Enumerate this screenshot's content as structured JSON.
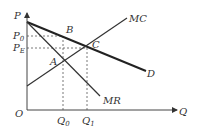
{
  "diagram": {
    "type": "monopoly-pricing",
    "axes": {
      "y_label": "P",
      "x_label": "Q",
      "origin_label": "O"
    },
    "curves": {
      "demand": {
        "label": "D",
        "color": "#222222"
      },
      "marginal_revenue": {
        "label": "MR",
        "color": "#333333"
      },
      "marginal_cost": {
        "label": "MC",
        "color": "#333333"
      }
    },
    "points": {
      "A": "A",
      "B": "B",
      "C": "C"
    },
    "price_levels": {
      "p0": {
        "base": "P",
        "sub": "0"
      },
      "pe": {
        "base": "P",
        "sub": "E"
      }
    },
    "quantity_levels": {
      "q0": {
        "base": "Q",
        "sub": "0"
      },
      "q1": {
        "base": "Q",
        "sub": "1"
      }
    }
  }
}
